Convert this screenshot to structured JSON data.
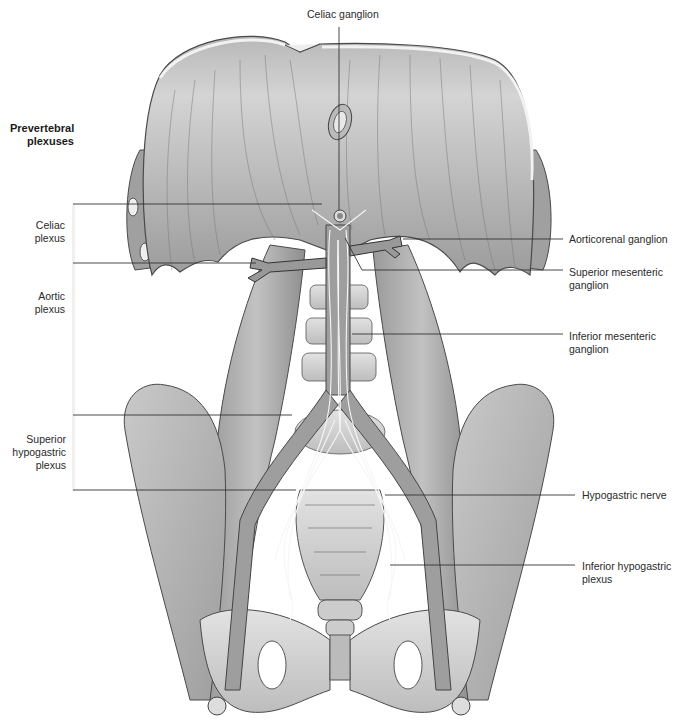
{
  "figure": {
    "title": "Prevertebral plexuses",
    "title_lines": [
      "Prevertebral",
      "plexuses"
    ]
  },
  "left_labels": [
    {
      "id": "celiac-plexus",
      "lines": [
        "Celiac",
        "plexus"
      ]
    },
    {
      "id": "aortic-plexus",
      "lines": [
        "Aortic",
        "plexus"
      ]
    },
    {
      "id": "superior-hypogastric-plexus",
      "lines": [
        "Superior",
        "hypogastric",
        "plexus"
      ]
    }
  ],
  "top_label": {
    "id": "celiac-ganglion",
    "text": "Celiac ganglion"
  },
  "right_labels": [
    {
      "id": "aorticorenal-ganglion",
      "lines": [
        "Aorticorenal ganglion"
      ]
    },
    {
      "id": "superior-mesenteric-ganglion",
      "lines": [
        "Superior mesenteric",
        "ganglion"
      ]
    },
    {
      "id": "inferior-mesenteric-ganglion",
      "lines": [
        "Inferior mesenteric",
        "ganglion"
      ]
    },
    {
      "id": "hypogastric-nerve",
      "lines": [
        "Hypogastric nerve"
      ]
    },
    {
      "id": "inferior-hypogastric-plexus",
      "lines": [
        "Inferior hypogastric",
        "plexus"
      ]
    }
  ],
  "colors": {
    "muscle": "#a9a9a9",
    "muscle_dark": "#8c8c8c",
    "muscle_light": "#cfcfcf",
    "bone": "#d6d6d6",
    "vessel": "#9a9a9a",
    "nerve": "#f4f4f4",
    "leader_line": "#333333",
    "outline": "#4a4a4a"
  }
}
